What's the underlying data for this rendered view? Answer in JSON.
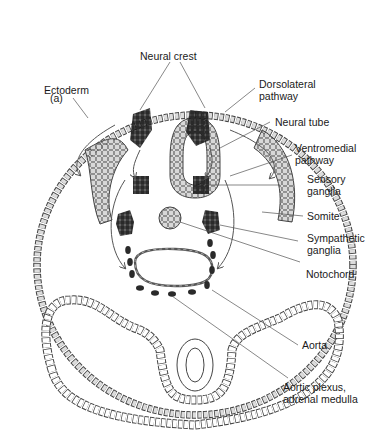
{
  "figure": {
    "panel_label": "(a)",
    "labels": {
      "ectoderm": "Ectoderm",
      "neural_crest": "Neural crest",
      "dorsolateral_1": "Dorsolateral",
      "dorsolateral_2": "pathway",
      "neural_tube": "Neural tube",
      "ventromedial_1": "Ventromedial",
      "ventromedial_2": "pathway",
      "sensory_1": "Sensory",
      "sensory_2": "ganglia",
      "somite": "Somite",
      "sympathetic_1": "Sympathetic",
      "sympathetic_2": "ganglia",
      "notochord": "Notochord",
      "aorta": "Aorta",
      "aortic_1": "Aortic plexus,",
      "aortic_2": "adrenal medulla"
    },
    "colors": {
      "cell_fill": "#d8d8d8",
      "crest_cell_fill": "#2a2a2a",
      "outline": "#333333",
      "leader_line": "#555555"
    }
  }
}
